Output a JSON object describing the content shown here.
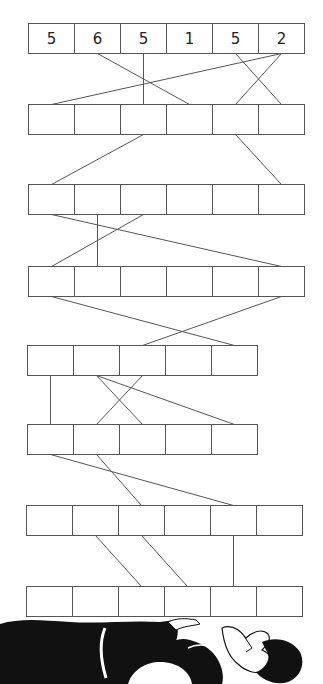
{
  "puzzle": {
    "type": "number-pyramid-connections",
    "rows": [
      {
        "index": 1,
        "cells": [
          "5",
          "6",
          "5",
          "1",
          "5",
          "2"
        ]
      },
      {
        "index": 2,
        "cells": [
          "",
          "",
          "",
          "",
          "",
          ""
        ]
      },
      {
        "index": 3,
        "cells": [
          "",
          "",
          "",
          "",
          "",
          ""
        ]
      },
      {
        "index": 4,
        "cells": [
          "",
          "",
          "",
          "",
          "",
          ""
        ]
      },
      {
        "index": 5,
        "cells": [
          "",
          "",
          "",
          "",
          ""
        ]
      },
      {
        "index": 6,
        "cells": [
          "",
          "",
          "",
          "",
          ""
        ]
      },
      {
        "index": 7,
        "cells": [
          "",
          "",
          "",
          "",
          "",
          ""
        ]
      },
      {
        "index": 8,
        "cells": [
          "",
          "",
          "",
          "",
          "",
          ""
        ]
      }
    ],
    "connections": [
      {
        "from_row": 1,
        "from_cell": 2,
        "to_row": 2,
        "to_cell": 4
      },
      {
        "from_row": 1,
        "from_cell": 3,
        "to_row": 2,
        "to_cell": 3
      },
      {
        "from_row": 1,
        "from_cell": 6,
        "to_row": 2,
        "to_cell": 1
      },
      {
        "from_row": 1,
        "from_cell": 5,
        "to_row": 2,
        "to_cell": 6
      },
      {
        "from_row": 1,
        "from_cell": 6,
        "to_row": 2,
        "to_cell": 5
      },
      {
        "from_row": 2,
        "from_cell": 3,
        "to_row": 3,
        "to_cell": 1
      },
      {
        "from_row": 2,
        "from_cell": 5,
        "to_row": 3,
        "to_cell": 6
      },
      {
        "from_row": 3,
        "from_cell": 1,
        "to_row": 4,
        "to_cell": 6
      },
      {
        "from_row": 3,
        "from_cell": 2,
        "to_row": 4,
        "to_cell": 2
      },
      {
        "from_row": 3,
        "from_cell": 3,
        "to_row": 4,
        "to_cell": 1
      },
      {
        "from_row": 4,
        "from_cell": 1,
        "to_row": 5,
        "to_cell": 5
      },
      {
        "from_row": 4,
        "from_cell": 6,
        "to_row": 5,
        "to_cell": 3
      },
      {
        "from_row": 5,
        "from_cell": 1,
        "to_row": 6,
        "to_cell": 1
      },
      {
        "from_row": 5,
        "from_cell": 2,
        "to_row": 6,
        "to_cell": 3
      },
      {
        "from_row": 5,
        "from_cell": 3,
        "to_row": 6,
        "to_cell": 2
      },
      {
        "from_row": 5,
        "from_cell": 2,
        "to_row": 6,
        "to_cell": 5
      },
      {
        "from_row": 6,
        "from_cell": 1,
        "to_row": 7,
        "to_cell": 5
      },
      {
        "from_row": 6,
        "from_cell": 2,
        "to_row": 7,
        "to_cell": 3
      },
      {
        "from_row": 7,
        "from_cell": 2,
        "to_row": 8,
        "to_cell": 3
      },
      {
        "from_row": 7,
        "from_cell": 3,
        "to_row": 8,
        "to_cell": 4
      },
      {
        "from_row": 7,
        "from_cell": 5,
        "to_row": 8,
        "to_cell": 5
      }
    ],
    "illustration": "person-lying-supporting-boxes",
    "colors": {
      "line": "#555555",
      "text": "#222222",
      "figure": "#111111",
      "background": "#ffffff"
    }
  }
}
